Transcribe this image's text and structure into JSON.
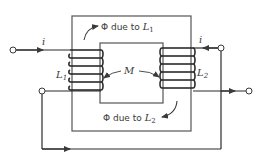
{
  "diagram": {
    "type": "magnetically coupled coils on a transformer core",
    "core": {
      "label": "magnetic core"
    },
    "coils": [
      {
        "id": "L1",
        "symbol": "L",
        "subscript": "1",
        "side": "left"
      },
      {
        "id": "L2",
        "symbol": "L",
        "subscript": "2",
        "side": "right"
      }
    ],
    "mutual_inductance": {
      "label": "M"
    },
    "flux_labels": [
      {
        "prefix": "Φ due to ",
        "symbol": "L",
        "subscript": "1",
        "position": "top"
      },
      {
        "prefix": "Φ due to ",
        "symbol": "L",
        "subscript": "2",
        "position": "bottom"
      }
    ],
    "currents": [
      {
        "label": "i",
        "terminal": "left-top",
        "direction": "into coil L1"
      },
      {
        "label": "i",
        "terminal": "right-top",
        "direction": "into coil L2"
      }
    ],
    "colors": {
      "line": "#3a3a3a",
      "background": "#ffffff"
    }
  }
}
